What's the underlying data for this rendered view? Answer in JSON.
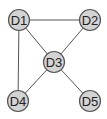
{
  "diagram": {
    "type": "undirected-graph",
    "colors": {
      "background": "#ffffff",
      "node_fill": "#d3d3d3",
      "node_stroke": "#555555",
      "edge": "#555555",
      "label": "#222222"
    },
    "node_radius": 10.5,
    "nodes": [
      {
        "id": "D1",
        "label": "D1",
        "x": 19,
        "y": 20
      },
      {
        "id": "D2",
        "label": "D2",
        "x": 90,
        "y": 20
      },
      {
        "id": "D3",
        "label": "D3",
        "x": 54,
        "y": 62
      },
      {
        "id": "D4",
        "label": "D4",
        "x": 18,
        "y": 101
      },
      {
        "id": "D5",
        "label": "D5",
        "x": 90,
        "y": 101
      }
    ],
    "edges": [
      {
        "from": "D1",
        "to": "D2"
      },
      {
        "from": "D1",
        "to": "D3"
      },
      {
        "from": "D1",
        "to": "D4"
      },
      {
        "from": "D2",
        "to": "D3"
      },
      {
        "from": "D3",
        "to": "D4"
      },
      {
        "from": "D3",
        "to": "D5"
      }
    ]
  }
}
